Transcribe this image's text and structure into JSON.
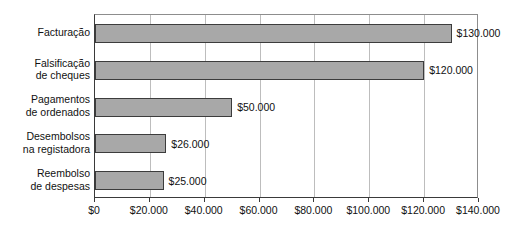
{
  "chart_data": {
    "type": "bar",
    "orientation": "horizontal",
    "title": "",
    "subtitle": "",
    "xlabel": "",
    "ylabel": "",
    "categories": [
      "Facturação",
      "Falsificação\nde cheques",
      "Pagamentos\nde ordenados",
      "Desembolsos\nna registadora",
      "Reembolso\nde despesas"
    ],
    "values": [
      130000,
      120000,
      50000,
      26000,
      25000
    ],
    "data_labels": [
      "$130.000",
      "$120.000",
      "$50.000",
      "$26.000",
      "$25.000"
    ],
    "xlim": [
      0,
      140000
    ],
    "xtick_values": [
      0,
      20000,
      40000,
      60000,
      80000,
      100000,
      120000,
      140000
    ],
    "xtick_labels": [
      "$0",
      "$20.000",
      "$40.000",
      "$60.000",
      "$80.000",
      "$100.000",
      "$120.000",
      "$140.000"
    ],
    "grid": "vertical",
    "legend": "none",
    "colors": {
      "bar_fill": "#a8a8a8",
      "bar_border": "#3c3c3c",
      "gridline": "#bdbdbd",
      "axis": "#3a3a3a",
      "background": "#ffffff",
      "text": "#111111"
    }
  }
}
